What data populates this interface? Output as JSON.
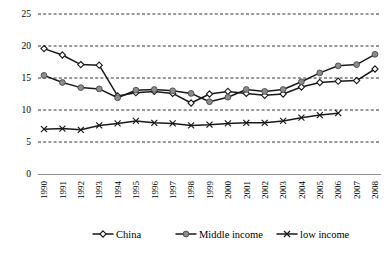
{
  "chart_data": {
    "type": "line",
    "title": "",
    "xlabel": "",
    "ylabel": "",
    "ylim": [
      0,
      25
    ],
    "yticks": [
      0,
      5,
      10,
      15,
      20,
      25
    ],
    "grid": true,
    "legend_position": "bottom",
    "categories": [
      "1990",
      "1991",
      "1992",
      "1993",
      "1994",
      "1995",
      "1996",
      "1997",
      "1998",
      "1999",
      "2000",
      "2001",
      "2002",
      "2003",
      "2004",
      "2005",
      "2006",
      "2007",
      "2008"
    ],
    "series": [
      {
        "name": "China",
        "marker": "hollow-diamond",
        "color": "#1a1a1a",
        "values": [
          19.6,
          18.6,
          17.1,
          17.0,
          12.2,
          12.7,
          12.9,
          12.6,
          11.1,
          12.5,
          12.9,
          12.6,
          12.3,
          12.5,
          13.6,
          14.3,
          14.5,
          14.6,
          16.4
        ]
      },
      {
        "name": "Middle income",
        "marker": "filled-circle",
        "color": "#8c8c8c",
        "values": [
          15.4,
          14.3,
          13.5,
          13.3,
          11.9,
          13.1,
          13.2,
          13.0,
          12.6,
          11.3,
          12.0,
          13.2,
          12.9,
          13.2,
          14.4,
          15.8,
          16.9,
          17.1,
          18.7
        ]
      },
      {
        "name": "low income",
        "marker": "cross",
        "color": "#1a1a1a",
        "values": [
          7.0,
          7.1,
          6.9,
          7.6,
          7.9,
          8.3,
          8.0,
          7.9,
          7.6,
          7.7,
          7.9,
          8.0,
          8.0,
          8.3,
          8.8,
          9.2,
          9.5,
          null,
          null
        ]
      }
    ]
  },
  "legend": {
    "items": [
      {
        "label": "China"
      },
      {
        "label": "Middle income"
      },
      {
        "label": "low income"
      }
    ]
  }
}
